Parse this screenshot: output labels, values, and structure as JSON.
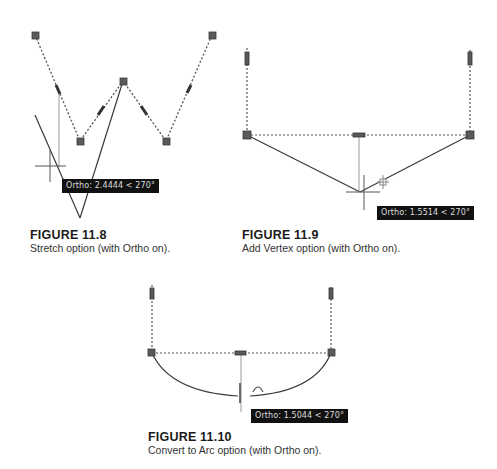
{
  "colors": {
    "grip": "#5a5a5a",
    "line": "#3a3a3a",
    "rubberband": "#9a9a9a",
    "tooltip_bg": "#111111",
    "tooltip_text": "#dcdcdc"
  },
  "figures": [
    {
      "id": "11.8",
      "title": "FIGURE 11.8",
      "caption": "Stretch option (with Ortho on).",
      "tooltip": "Ortho: 2.4444 < 270°"
    },
    {
      "id": "11.9",
      "title": "FIGURE 11.9",
      "caption": "Add Vertex option (with Ortho on).",
      "tooltip": "Ortho: 1.5514 < 270°"
    },
    {
      "id": "11.10",
      "title": "FIGURE 11.10",
      "caption": "Convert to Arc option (with Ortho on).",
      "tooltip": "Ortho: 1.5044 < 270°"
    }
  ]
}
